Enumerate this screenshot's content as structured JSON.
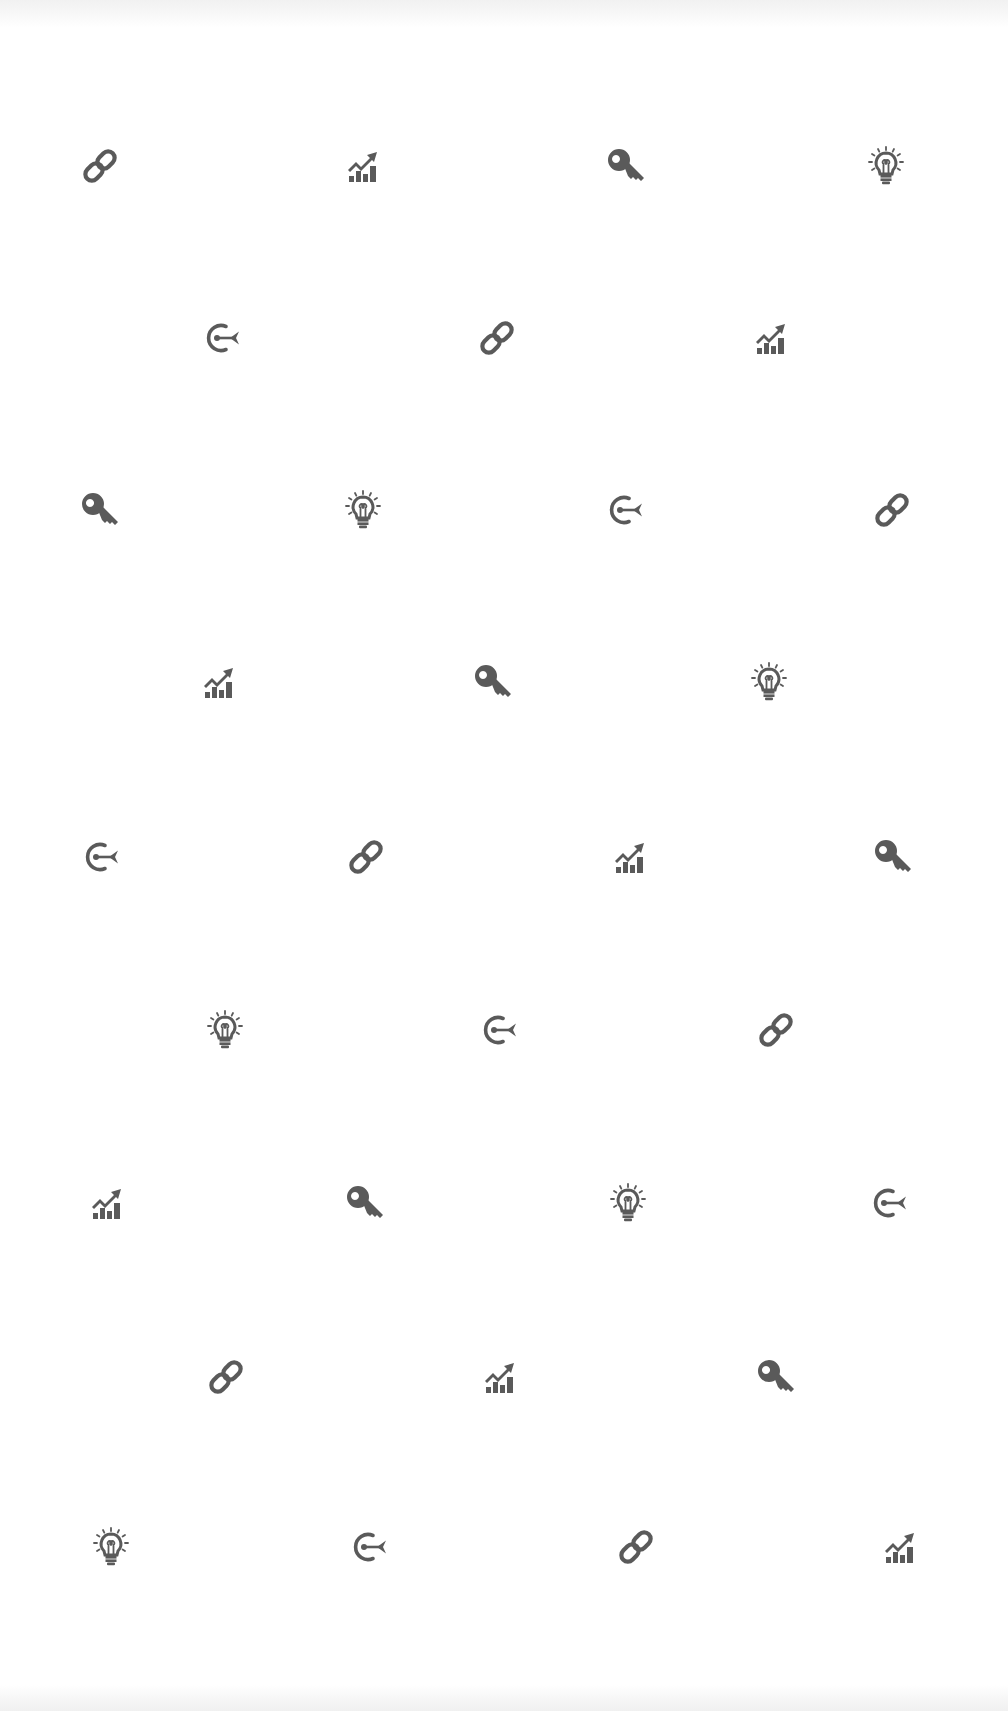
{
  "pattern": {
    "background": "#ffffff",
    "icon_color": "#5a5a5a",
    "icon_sequence": [
      "link-icon",
      "chart-icon",
      "key-icon",
      "bulb-icon",
      "target-icon"
    ],
    "rows": [
      {
        "y": 166,
        "icons": [
          {
            "x": 100,
            "type": "link-icon"
          },
          {
            "x": 363,
            "type": "chart-icon"
          },
          {
            "x": 626,
            "type": "key-icon"
          },
          {
            "x": 886,
            "type": "bulb-icon"
          }
        ]
      },
      {
        "y": 338,
        "icons": [
          {
            "x": 223,
            "type": "target-icon"
          },
          {
            "x": 497,
            "type": "link-icon"
          },
          {
            "x": 771,
            "type": "chart-icon"
          }
        ]
      },
      {
        "y": 510,
        "icons": [
          {
            "x": 100,
            "type": "key-icon"
          },
          {
            "x": 363,
            "type": "bulb-icon"
          },
          {
            "x": 626,
            "type": "target-icon"
          },
          {
            "x": 892,
            "type": "link-icon"
          }
        ]
      },
      {
        "y": 682,
        "icons": [
          {
            "x": 219,
            "type": "chart-icon"
          },
          {
            "x": 493,
            "type": "key-icon"
          },
          {
            "x": 769,
            "type": "bulb-icon"
          }
        ]
      },
      {
        "y": 857,
        "icons": [
          {
            "x": 102,
            "type": "target-icon"
          },
          {
            "x": 366,
            "type": "link-icon"
          },
          {
            "x": 630,
            "type": "chart-icon"
          },
          {
            "x": 893,
            "type": "key-icon"
          }
        ]
      },
      {
        "y": 1030,
        "icons": [
          {
            "x": 225,
            "type": "bulb-icon"
          },
          {
            "x": 500,
            "type": "target-icon"
          },
          {
            "x": 776,
            "type": "link-icon"
          }
        ]
      },
      {
        "y": 1203,
        "icons": [
          {
            "x": 107,
            "type": "chart-icon"
          },
          {
            "x": 365,
            "type": "key-icon"
          },
          {
            "x": 628,
            "type": "bulb-icon"
          },
          {
            "x": 890,
            "type": "target-icon"
          }
        ]
      },
      {
        "y": 1377,
        "icons": [
          {
            "x": 226,
            "type": "link-icon"
          },
          {
            "x": 500,
            "type": "chart-icon"
          },
          {
            "x": 776,
            "type": "key-icon"
          }
        ]
      },
      {
        "y": 1547,
        "icons": [
          {
            "x": 111,
            "type": "bulb-icon"
          },
          {
            "x": 370,
            "type": "target-icon"
          },
          {
            "x": 636,
            "type": "link-icon"
          },
          {
            "x": 900,
            "type": "chart-icon"
          }
        ]
      }
    ]
  }
}
